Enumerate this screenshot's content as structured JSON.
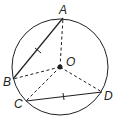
{
  "diagram": {
    "type": "circle-geometry",
    "circle": {
      "cx": 60,
      "cy": 67,
      "r": 48
    },
    "center": {
      "label": "O",
      "x": 60,
      "y": 67
    },
    "points": [
      {
        "label": "A",
        "x": 63,
        "y": 18
      },
      {
        "label": "B",
        "x": 13,
        "y": 79
      },
      {
        "label": "C",
        "x": 26,
        "y": 101
      },
      {
        "label": "D",
        "x": 102,
        "y": 92
      }
    ],
    "chords": [
      {
        "from": "A",
        "to": "B",
        "tick_marks": 1
      },
      {
        "from": "C",
        "to": "D",
        "tick_marks": 1
      }
    ],
    "dashed_radii": [
      "OA",
      "OB",
      "OC",
      "OD"
    ],
    "colors": {
      "stroke": "#231f20",
      "background": "#ffffff"
    }
  }
}
